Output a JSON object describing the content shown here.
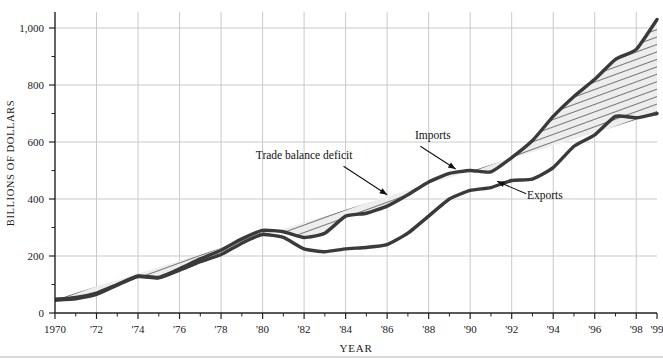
{
  "chart_data": {
    "type": "area",
    "title": "",
    "xlabel": "YEAR",
    "ylabel": "BILLIONS OF DOLLARS",
    "xlim": [
      1970,
      1999
    ],
    "ylim": [
      0,
      1000
    ],
    "grid": true,
    "legend_position": "inline-annotations",
    "x": [
      1970,
      1971,
      1972,
      1973,
      1974,
      1975,
      1976,
      1977,
      1978,
      1979,
      1980,
      1981,
      1982,
      1983,
      1984,
      1985,
      1986,
      1987,
      1988,
      1989,
      1990,
      1991,
      1992,
      1993,
      1994,
      1995,
      1996,
      1997,
      1998,
      1999
    ],
    "ytick_labels": [
      "0",
      "200",
      "400",
      "600",
      "800",
      "1,000"
    ],
    "ytick_values": [
      0,
      200,
      400,
      600,
      800,
      1000
    ],
    "xtick_labels": [
      "1970",
      "'72",
      "'74",
      "'76",
      "'78",
      "'80",
      "'82",
      "'84",
      "'86",
      "'88",
      "'90",
      "'92",
      "'94",
      "'96",
      "'98",
      "'99"
    ],
    "xtick_values": [
      1970,
      1972,
      1974,
      1976,
      1978,
      1980,
      1982,
      1984,
      1986,
      1988,
      1990,
      1992,
      1994,
      1996,
      1998,
      1999
    ],
    "series": [
      {
        "name": "Imports",
        "color": "#3a3a3a",
        "values": [
          48,
          55,
          70,
          100,
          130,
          125,
          155,
          190,
          220,
          260,
          290,
          285,
          265,
          280,
          340,
          350,
          375,
          415,
          460,
          490,
          500,
          495,
          545,
          605,
          690,
          760,
          820,
          890,
          925,
          1030
        ]
      },
      {
        "name": "Exports",
        "color": "#3a3a3a",
        "values": [
          45,
          50,
          65,
          98,
          128,
          123,
          150,
          180,
          205,
          245,
          275,
          265,
          225,
          215,
          225,
          230,
          240,
          280,
          340,
          400,
          430,
          440,
          465,
          470,
          510,
          585,
          625,
          690,
          685,
          700
        ]
      }
    ],
    "band": {
      "name": "Trade balance deficit",
      "fill": "#ebebeb",
      "hatch": "diagonal-lines"
    },
    "annotations": [
      {
        "name": "imports-annotation",
        "text": "Imports",
        "x": 1988.2,
        "y": 610
      },
      {
        "name": "trade-balance-annotation",
        "text": "Trade balance deficit",
        "x": 1982.0,
        "y": 540
      },
      {
        "name": "exports-annotation",
        "text": "Exports",
        "x": 1993.6,
        "y": 400
      }
    ]
  },
  "axes": {
    "y_title": "BILLIONS OF DOLLARS",
    "x_title": "YEAR"
  },
  "colors": {
    "line": "#3a3a3a",
    "band_fill": "#ebebeb",
    "grid": "#c9c9c9",
    "axis": "#222222",
    "background": "#ffffff",
    "footer_rule": "#b3b3b3"
  }
}
